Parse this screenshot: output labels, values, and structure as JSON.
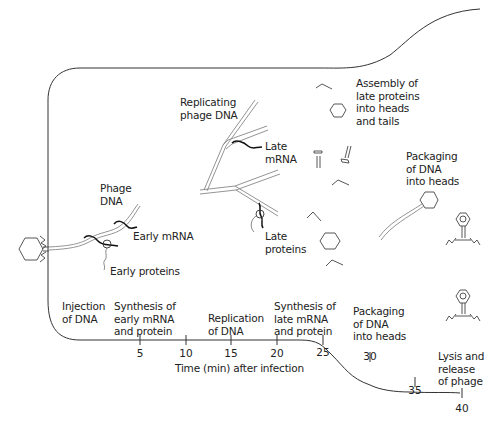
{
  "diagram": {
    "labels": {
      "replicating_phage_dna": "Replicating\nphage DNA",
      "assembly": "Assembly of\nlate proteins\ninto heads\nand tails",
      "phage_dna": "Phage\nDNA",
      "early_mrna": "Early mRNA",
      "early_proteins": "Early proteins",
      "late_mrna": "Late\nmRNA",
      "late_proteins": "Late\nproteins",
      "packaging_top": "Packaging\nof DNA\ninto heads"
    },
    "timeline": {
      "axis_label": "Time (min) after infection",
      "ticks": [
        "5",
        "10",
        "15",
        "20",
        "25",
        "30",
        "35",
        "40"
      ],
      "stages": [
        {
          "label": "Injection\nof DNA"
        },
        {
          "label": "Synthesis of\nearly mRNA\nand protein"
        },
        {
          "label": "Replication\nof DNA"
        },
        {
          "label": "Synthesis of\nlate mRNA\nand protein"
        },
        {
          "label": "Packaging\nof DNA\ninto heads"
        },
        {
          "label": "Lysis and\nrelease\nof phage"
        }
      ]
    },
    "icons": [
      "phage-icon",
      "phage-head-icon",
      "phage-tail-icon",
      "tail-fiber-icon",
      "dna-strand-icon",
      "mrna-icon",
      "ribosome-icon"
    ]
  }
}
